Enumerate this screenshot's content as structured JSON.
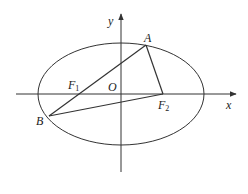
{
  "diagram": {
    "type": "ellipse-focal-triangle",
    "colors": {
      "stroke": "#333333",
      "background": "#ffffff"
    },
    "axes": {
      "x_label": "x",
      "y_label": "y",
      "origin_label": "O"
    },
    "ellipse": {
      "cx": 121,
      "cy": 94,
      "rx": 83,
      "ry": 51
    },
    "points": {
      "A": {
        "label": "A",
        "x": 146,
        "y": 45
      },
      "B": {
        "label": "B",
        "x": 49,
        "y": 116
      },
      "F1": {
        "label": "F",
        "sub": "1",
        "x": 79,
        "y": 94
      },
      "F2": {
        "label": "F",
        "sub": "2",
        "x": 163,
        "y": 94
      }
    },
    "segments": [
      "A-F2",
      "B-F2",
      "B-A (through F1)"
    ]
  }
}
